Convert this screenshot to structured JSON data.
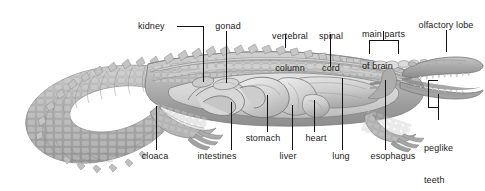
{
  "figure": {
    "style": "grayscale scientific illustration, lateral cutaway view",
    "background_color": "#ffffff",
    "text_color": "#1a1a1a",
    "leader_color": "#111111",
    "organ_fill": "#c9c9c9",
    "body_fill": "#b4b4b4",
    "width": 485,
    "height": 191
  },
  "labels": {
    "kidney": "kidney",
    "gonad": "gonad",
    "vertebral_column_line1": "vertebral",
    "vertebral_column_line2": "column",
    "spinal_cord_line1": "spinal",
    "spinal_cord_line2": "cord",
    "main_parts_of_brain_line1": "main parts",
    "main_parts_of_brain_line2": "of brain",
    "olfactory_lobe": "olfactory lobe",
    "peglike_teeth_line1": "peglike",
    "peglike_teeth_line2": "teeth",
    "cloaca": "cloaca",
    "intestines": "intestines",
    "stomach": "stomach",
    "liver": "liver",
    "heart": "heart",
    "lung": "lung",
    "esophagus": "esophagus"
  },
  "parts": [
    {
      "name": "kidney",
      "label": "kidney",
      "leader": "horizontal-then-vertical"
    },
    {
      "name": "gonad",
      "label": "gonad",
      "leader": "vertical"
    },
    {
      "name": "vertebral-column",
      "label": "vertebral column",
      "leader": "vertical"
    },
    {
      "name": "spinal-cord",
      "label": "spinal cord",
      "leader": "vertical"
    },
    {
      "name": "main-parts-of-brain",
      "label": "main parts of brain",
      "leader": "bracket"
    },
    {
      "name": "olfactory-lobe",
      "label": "olfactory lobe",
      "leader": "vertical"
    },
    {
      "name": "peglike-teeth",
      "label": "peglike teeth",
      "leader": "bracket"
    },
    {
      "name": "cloaca",
      "label": "cloaca",
      "leader": "vertical"
    },
    {
      "name": "intestines",
      "label": "intestines",
      "leader": "vertical"
    },
    {
      "name": "stomach",
      "label": "stomach",
      "leader": "vertical"
    },
    {
      "name": "liver",
      "label": "liver",
      "leader": "vertical"
    },
    {
      "name": "heart",
      "label": "heart",
      "leader": "vertical"
    },
    {
      "name": "lung",
      "label": "lung",
      "leader": "vertical"
    },
    {
      "name": "esophagus",
      "label": "esophagus",
      "leader": "vertical"
    }
  ]
}
